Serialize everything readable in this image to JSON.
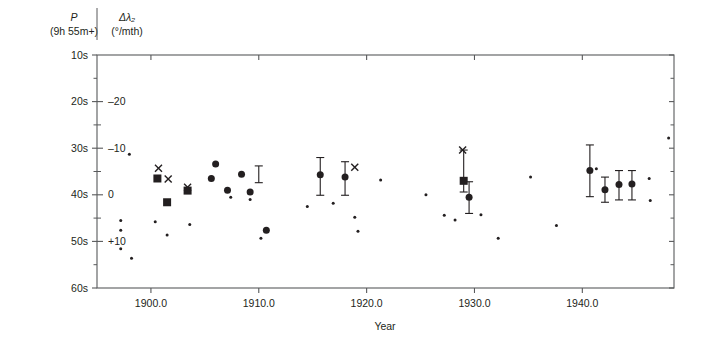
{
  "figure": {
    "background": "#ffffff",
    "ink_color": "#231f20",
    "axis_color": "#58595b"
  },
  "axes": {
    "left": {
      "title_line1": "P",
      "title_line2": "(9h 55m+)",
      "ticks": [
        "10s",
        "20s",
        "30s",
        "40s",
        "50s",
        "60s"
      ],
      "tick_values": [
        10,
        20,
        30,
        40,
        50,
        60
      ]
    },
    "inner_right": {
      "title_line1": "Δλ₂",
      "title_line2": "(°/mth)",
      "ticks": [
        "–20",
        "–10",
        "0",
        "+10"
      ],
      "tick_values": [
        -20,
        -10,
        0,
        10
      ]
    },
    "bottom": {
      "title": "Year",
      "ticks": [
        "1900.0",
        "1910.0",
        "1920.0",
        "1930.0",
        "1940.0"
      ],
      "tick_values": [
        1900,
        1910,
        1920,
        1930,
        1940
      ]
    }
  },
  "chart_data": {
    "type": "scatter",
    "title": "",
    "subtitle": "",
    "xlabel": "Year",
    "ylabel": "P (9h 55m+)",
    "y2label": "Δλ₂ (°/mth)",
    "xlim": [
      1895.0,
      1948.5
    ],
    "ylim": [
      60,
      10
    ],
    "y2lim": [
      14.0,
      -24.0
    ],
    "grid": false,
    "legend": null,
    "y_axis_note": "Left axis P in seconds (9h 55m + value); axis inverted so 10s at top, 60s at bottom. Right inner axis Δλ2 in deg/month aligned so P=40s corresponds to 0 deg/mth and 10s increase in P corresponds to +10 deg/mth.",
    "series": [
      {
        "name": "small-dots",
        "marker": "small-filled-circle",
        "size_px": 3.0,
        "points": [
          {
            "x": 1898.0,
            "y": 31.3
          },
          {
            "x": 1897.2,
            "y": 45.5
          },
          {
            "x": 1897.2,
            "y": 47.6
          },
          {
            "x": 1897.2,
            "y": 51.6
          },
          {
            "x": 1898.2,
            "y": 53.6
          },
          {
            "x": 1900.4,
            "y": 45.8
          },
          {
            "x": 1901.5,
            "y": 48.6
          },
          {
            "x": 1903.6,
            "y": 46.4
          },
          {
            "x": 1907.4,
            "y": 40.5
          },
          {
            "x": 1909.2,
            "y": 41.0
          },
          {
            "x": 1910.2,
            "y": 49.3
          },
          {
            "x": 1914.5,
            "y": 42.5
          },
          {
            "x": 1916.9,
            "y": 41.8
          },
          {
            "x": 1918.9,
            "y": 44.8
          },
          {
            "x": 1919.2,
            "y": 47.8
          },
          {
            "x": 1921.3,
            "y": 36.8
          },
          {
            "x": 1925.5,
            "y": 40.0
          },
          {
            "x": 1927.2,
            "y": 44.4
          },
          {
            "x": 1928.2,
            "y": 45.4
          },
          {
            "x": 1930.6,
            "y": 44.3
          },
          {
            "x": 1932.2,
            "y": 49.3
          },
          {
            "x": 1935.2,
            "y": 36.2
          },
          {
            "x": 1937.6,
            "y": 46.6
          },
          {
            "x": 1941.3,
            "y": 34.4
          },
          {
            "x": 1946.2,
            "y": 36.5
          },
          {
            "x": 1946.3,
            "y": 41.2
          },
          {
            "x": 1948.0,
            "y": 27.8
          }
        ]
      },
      {
        "name": "large-dots",
        "marker": "large-filled-circle",
        "size_px": 7.0,
        "points": [
          {
            "x": 1905.6,
            "y": 36.5
          },
          {
            "x": 1906.0,
            "y": 33.4
          },
          {
            "x": 1907.1,
            "y": 39.0
          },
          {
            "x": 1908.4,
            "y": 35.6
          },
          {
            "x": 1909.2,
            "y": 39.4
          },
          {
            "x": 1910.7,
            "y": 47.6
          },
          {
            "x": 1915.7,
            "y": 35.7
          },
          {
            "x": 1918.0,
            "y": 36.2
          },
          {
            "x": 1929.5,
            "y": 40.5
          },
          {
            "x": 1940.7,
            "y": 34.8
          },
          {
            "x": 1942.1,
            "y": 38.9
          },
          {
            "x": 1943.4,
            "y": 37.8
          },
          {
            "x": 1944.6,
            "y": 37.7
          }
        ]
      },
      {
        "name": "squares",
        "marker": "filled-square",
        "size_px": 8.0,
        "points": [
          {
            "x": 1900.6,
            "y": 36.5
          },
          {
            "x": 1901.5,
            "y": 41.6
          },
          {
            "x": 1903.4,
            "y": 39.1
          },
          {
            "x": 1929.0,
            "y": 37.0
          }
        ]
      },
      {
        "name": "crosses",
        "marker": "x-cross",
        "size_px": 7.0,
        "points": [
          {
            "x": 1900.7,
            "y": 34.3
          },
          {
            "x": 1901.6,
            "y": 36.6
          },
          {
            "x": 1903.4,
            "y": 38.4
          },
          {
            "x": 1918.9,
            "y": 34.1
          },
          {
            "x": 1928.9,
            "y": 30.4
          }
        ]
      },
      {
        "name": "error-bars",
        "marker": "vertical-error-bar",
        "bars": [
          {
            "x": 1915.7,
            "y": 35.7,
            "ylow": 40.1,
            "yhigh": 32.0
          },
          {
            "x": 1918.0,
            "y": 36.2,
            "ylow": 40.1,
            "yhigh": 32.9
          },
          {
            "x": 1929.0,
            "y": 37.0,
            "ylow": 39.4,
            "yhigh": 30.4
          },
          {
            "x": 1929.5,
            "y": 40.5,
            "ylow": 44.0,
            "yhigh": 37.2
          },
          {
            "x": 1940.7,
            "y": 34.8,
            "ylow": 40.4,
            "yhigh": 29.3
          },
          {
            "x": 1942.1,
            "y": 38.9,
            "ylow": 41.6,
            "yhigh": 36.2
          },
          {
            "x": 1943.4,
            "y": 37.8,
            "ylow": 41.1,
            "yhigh": 34.8
          },
          {
            "x": 1944.6,
            "y": 37.7,
            "ylow": 41.1,
            "yhigh": 34.8
          },
          {
            "x": 1910.0,
            "y": 36.0,
            "ylow": 37.4,
            "yhigh": 33.8
          }
        ]
      }
    ]
  }
}
